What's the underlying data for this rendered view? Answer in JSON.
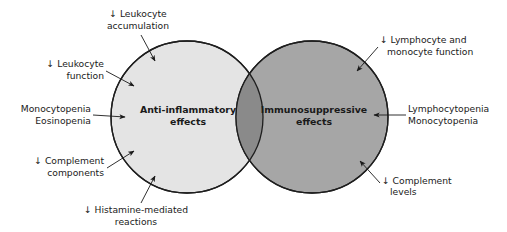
{
  "diagram": {
    "type": "venn",
    "colors": {
      "background": "#ffffff",
      "left_circle_fill": "#e4e4e4",
      "right_circle_fill": "#a6a6a6",
      "overlap_fill": "#8a8a8a",
      "stroke": "#1e1e1e",
      "text": "#1a1a1a"
    },
    "circles": [
      {
        "id": "anti-inflammatory",
        "label_line1": "Anti-inflammatory",
        "label_line2": "effects",
        "cx": 187,
        "cy": 117,
        "r": 76
      },
      {
        "id": "immunosuppressive",
        "label_line1": "Immunosuppressive",
        "label_line2": "effects",
        "cx": 312,
        "cy": 117,
        "r": 76
      }
    ],
    "left_annotations": [
      {
        "line1": "↓ Leukocyte",
        "line2": "accumulation"
      },
      {
        "line1": "↓ Leukocyte",
        "line2": "function"
      },
      {
        "line1": "Monocytopenia",
        "line2": "Eosinopenia"
      },
      {
        "line1": "↓ Complement",
        "line2": "components"
      },
      {
        "line1": "↓ Histamine-mediated",
        "line2": "reactions"
      }
    ],
    "right_annotations": [
      {
        "line1": "↓ Lymphocyte and",
        "line2": "monocyte function"
      },
      {
        "line1": "Lymphocytopenia",
        "line2": "Monocytopenia"
      },
      {
        "line1": "↓ Complement",
        "line2": "levels"
      }
    ]
  }
}
